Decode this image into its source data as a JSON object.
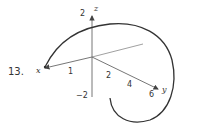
{
  "problem": {
    "number": "13."
  },
  "axes": {
    "x": {
      "label": "x",
      "ticks": [
        "1"
      ]
    },
    "y": {
      "label": "y",
      "ticks": [
        "2",
        "4",
        "6"
      ]
    },
    "z": {
      "label": "z",
      "ticks": [
        "2",
        "−2"
      ]
    }
  },
  "colors": {
    "axis": "#555555",
    "curve": "#333333",
    "text": "#333333"
  }
}
